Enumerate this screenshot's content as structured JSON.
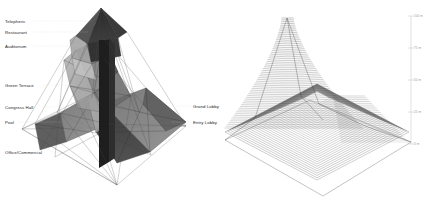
{
  "figure": {
    "background": "#ffffff",
    "ink": "#1b1b1b",
    "line_color": "#444444",
    "leader_color": "#c8c8c8",
    "scale_color": "#b0b0b0"
  },
  "left_diagram": {
    "name": "program-massing-axonometric",
    "labels_left": [
      {
        "text": "Telepheric",
        "x": 5,
        "y": 19,
        "leader_to_x": 92
      },
      {
        "text": "Restaurant",
        "x": 5,
        "y": 30,
        "leader_to_x": 88
      },
      {
        "text": "Auditorium",
        "x": 5,
        "y": 44,
        "leader_to_x": 80
      },
      {
        "text": "Green Terrace",
        "x": 5,
        "y": 83,
        "leader_to_x": 76
      },
      {
        "text": "Congress Hall",
        "x": 5,
        "y": 105,
        "leader_to_x": 66
      },
      {
        "text": "Pool",
        "x": 5,
        "y": 120,
        "leader_to_x": 62
      },
      {
        "text": "Office/Commercial",
        "x": 5,
        "y": 150,
        "leader_to_x": 70
      }
    ],
    "labels_right": [
      {
        "text": "Grand Lobby",
        "x": 193,
        "y": 104,
        "leader_to_x": 176
      },
      {
        "text": "Entry Lobby",
        "x": 193,
        "y": 120,
        "leader_to_x": 172
      }
    ]
  },
  "right_diagram": {
    "name": "contour-terrain-surface",
    "scale": {
      "axis_x": 411,
      "top_y": 16,
      "bottom_y": 144,
      "ticks": [
        {
          "label": "100 m",
          "y": 16
        },
        {
          "label": "75 m",
          "y": 48
        },
        {
          "label": "50 m",
          "y": 80
        },
        {
          "label": "25 m",
          "y": 112
        },
        {
          "label": "0 m",
          "y": 144
        }
      ]
    }
  },
  "chart_data": {
    "type": "area",
    "title": "",
    "xlabel": "",
    "ylabel": "Elevation",
    "ylim": [
      0,
      100
    ],
    "tick_labels": [
      "0 m",
      "25 m",
      "50 m",
      "75 m",
      "100 m"
    ],
    "legend": [
      "Telepheric",
      "Restaurant",
      "Auditorium",
      "Green Terrace",
      "Congress Hall",
      "Pool",
      "Office/Commercial",
      "Grand Lobby",
      "Entry Lobby"
    ],
    "series": [
      {
        "name": "Program elevations (m)",
        "categories": [
          "Office/Commercial",
          "Entry Lobby",
          "Pool",
          "Grand Lobby",
          "Congress Hall",
          "Green Terrace",
          "Auditorium",
          "Restaurant",
          "Telepheric"
        ],
        "values": [
          6,
          12,
          22,
          28,
          36,
          52,
          74,
          88,
          97
        ]
      }
    ]
  }
}
